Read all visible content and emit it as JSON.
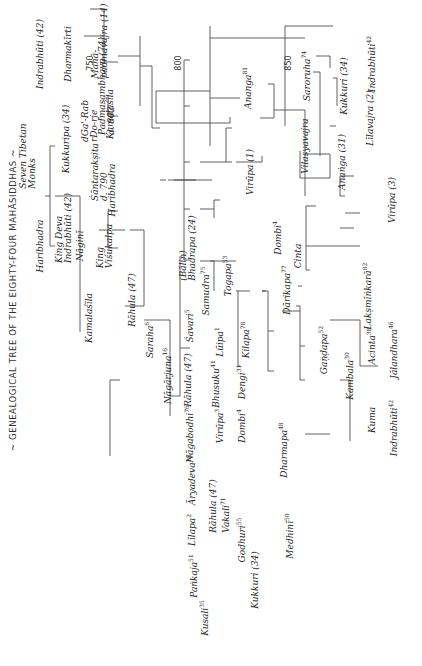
{
  "title": "~ GENEALOGICAL TREE OF THE EIGHTY-FOUR MAHĀSIDDHAS ~",
  "dates": [
    "750",
    "800",
    "850"
  ],
  "nodes": {
    "king_deva": "King Deva",
    "indrabhuti_42_top": "Indrabhūti (42)",
    "nagini": "Nāginī",
    "king_visukalpa_1": "King",
    "king_visukalpa_2": "Viśukalpa",
    "kukkuripa": "Kukkuripa (34)",
    "nga_rab": "dGa'-Rab",
    "rdo_rje": "rDo-rje",
    "indrabhuti_42": "Indrabhūti (42)",
    "dharmakirti": "Dharmakīrti",
    "maha_1": "Mahā-",
    "maha_2": "padmavajra (14)",
    "padmasambhava": "Padmasambhava (74)",
    "padma_date": "d. 802",
    "shantarakshita": "Śāntarakṣita",
    "shanta_date": "d. 790",
    "kamalashila": "Kamalaśīla",
    "haribhadra": "Haribhadra",
    "seven_1": "Seven",
    "seven_2": "Tibetan",
    "seven_3": "Monks",
    "rahula_47_top": "Rāhula (47)",
    "saraha": "Saraha",
    "nagarjuna": "Nāgārjuna",
    "savari": "Śavari",
    "rahula_47": "Rāhula (47)",
    "nagabodhi": "Nāgabodhi",
    "aryadeva": "Āryadeva",
    "lilapa": "Līlapa",
    "pankaja": "Paṅkaja",
    "kusali": "Kusali",
    "rahula_vakali_1": "Rāhula (47)",
    "rahula_vakali_2": "Vakali",
    "godhuri": "Godhuri",
    "kukkuri_34": "Kukkuri (34)",
    "medhini": "Medhinī",
    "bhusuku": "Bhusuku",
    "virupa": "Virūpa",
    "luipa": "Lūipa",
    "dengi": "Dengi",
    "dombi_top": "Dombi",
    "kilapa": "Kilapa",
    "dharmapa": "Dharmapa",
    "shantideva_bhadra_1": "(Bālin)",
    "shantideva_bhadra_2": "Bhadrapa (24)",
    "samudra": "Samudra",
    "togapa": "Togapa",
    "darikapa": "Dārikapa",
    "dombi": "Dombi",
    "cinta": "Cinta",
    "gandapa": "Gaṇḍapa",
    "kambala": "Kambala",
    "kuma": "Kuma",
    "indrabhuti_42_r": "Indrabhūti",
    "acinta": "Acinta",
    "lakshminkara": "Lakṣmīṅkarā",
    "jalandhara": "Jālandhara",
    "virupa_1": "Virūpa (1)",
    "vilasyavajra": "Vilasyavajra",
    "anangavajra_31": "Anaṅga (31)",
    "lilavajra": "Līlavajra (2)",
    "virupa_3": "Virūpa (3)",
    "ananga_81": "Ananga",
    "saroruha": "Saroruha",
    "kukkuri_34_b": "Kukkuri (34)",
    "indrabhuti_42_b": "Indrabhūti"
  },
  "numbers": {
    "saraha": "6",
    "nagarjuna": "16",
    "savari": "5",
    "nagabodhi": "76",
    "aryadeva": "18",
    "lilapa": "2",
    "pankaja": "51",
    "kusali": "35",
    "vakali": "71",
    "godhuri": "55",
    "medhini": "50",
    "bhusuku": "41",
    "virupa": "3",
    "luipa": "1",
    "dengi": "31",
    "dombi_top": "4",
    "kilapa": "78",
    "dharmapa": "48",
    "samudra": "75",
    "togapa": "53",
    "darikapa": "77",
    "dombi": "4",
    "gandapa": "52",
    "kambala": "30",
    "indrabhuti_r": "42",
    "acinta": "38",
    "lakshminkara": "82",
    "jalandhara": "46",
    "ananga_81": "81",
    "saroruha": "74",
    "indrabhuti_b": "42"
  }
}
